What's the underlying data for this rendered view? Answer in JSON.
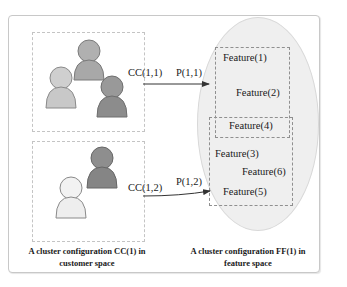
{
  "customer_space": {
    "caption": "A cluster configuration CC(1) in customer space",
    "caption_line1": "A cluster configuration CC(1) in",
    "caption_line2": "customer space",
    "clusters": [
      {
        "label": "CC(1,1)",
        "arrow_label": "P(1,1)",
        "people": [
          "light-gray-person",
          "mid-gray-person",
          "dark-gray-person"
        ]
      },
      {
        "label": "CC(1,2)",
        "arrow_label": "P(1,2)",
        "people": [
          "white-person",
          "dark-gray-person"
        ]
      }
    ]
  },
  "feature_space": {
    "caption": "A cluster configuration FF(1) in feature space",
    "caption_line1": "A cluster configuration FF(1) in",
    "caption_line2": "feature space",
    "groups": [
      {
        "features": [
          "Feature(1)",
          "Feature(2)"
        ]
      },
      {
        "features": [
          "Feature(4)"
        ]
      },
      {
        "features": [
          "Feature(3)",
          "Feature(6)",
          "Feature(5)"
        ]
      }
    ]
  },
  "colors": {
    "frame_border": "#c8c8c8",
    "ellipse_fill": "#efefef",
    "person_light": "#cfcfcf",
    "person_mid": "#a8a8a8",
    "person_dark": "#8c8c8c",
    "person_white": "#f2f2f2",
    "arrow": "#333333"
  }
}
